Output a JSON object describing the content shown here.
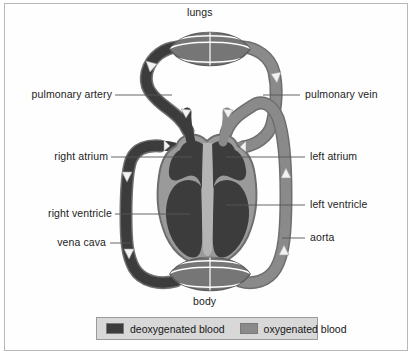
{
  "diagram": {
    "title_top": "lungs",
    "title_bottom": "body",
    "labels": {
      "pulmonary_artery": "pulmonary artery",
      "pulmonary_vein": "pulmonary vein",
      "right_atrium": "right atrium",
      "left_atrium": "left atrium",
      "right_ventricle": "right ventricle",
      "left_ventricle": "left ventricle",
      "vena_cava": "vena cava",
      "aorta": "aorta"
    },
    "colors": {
      "deoxygenated": "#3c3c3c",
      "oxygenated": "#8a8a8a",
      "arrow": "#f2f2f2",
      "outline": "#6e6e6e",
      "frame_border": "#b9b9b9",
      "legend_background": "#d8d8d8",
      "legend_border": "#9a9a9a",
      "text": "#1c1c1c",
      "leader_line": "#555555",
      "page_background": "#ffffff"
    }
  },
  "legend": {
    "items": [
      {
        "label": "deoxygenated blood",
        "color": "#3c3c3c",
        "swatch_name": "deoxygenated-swatch"
      },
      {
        "label": "oxygenated blood",
        "color": "#8a8a8a",
        "swatch_name": "oxygenated-swatch"
      }
    ]
  }
}
